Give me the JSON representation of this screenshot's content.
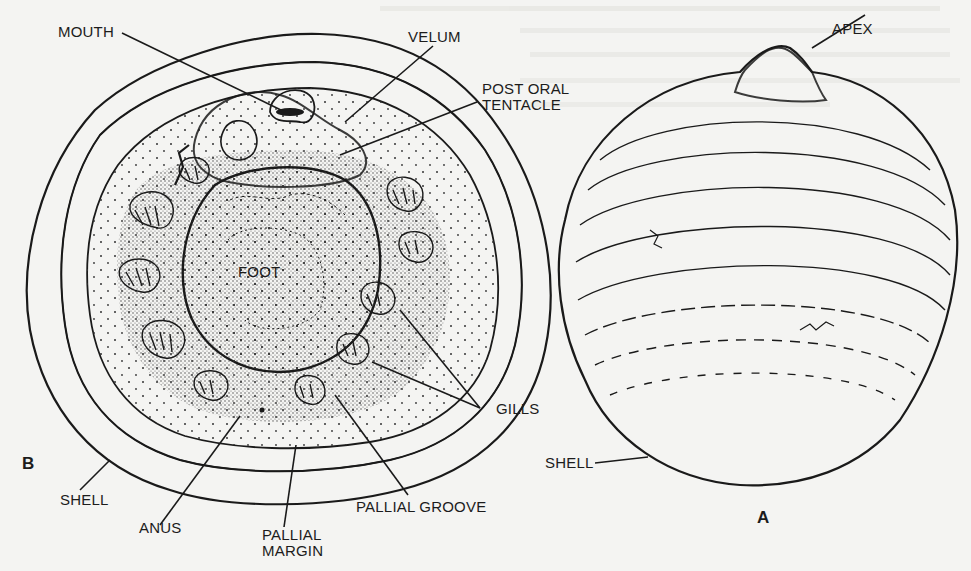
{
  "figure": {
    "background_color": "#f4f4f2",
    "ink_color": "#1a1a1a"
  },
  "panels": {
    "B": {
      "panel_label": "B",
      "view": "ventral",
      "labels": {
        "mouth": "MOUTH",
        "velum": "VELUM",
        "post_oral_tentacle_line1": "POST ORAL",
        "post_oral_tentacle_line2": "TENTACLE",
        "foot": "FOOT",
        "gills": "GILLS",
        "shell": "SHELL",
        "anus": "ANUS",
        "pallial_margin_line1": "PALLIAL",
        "pallial_margin_line2": "MARGIN",
        "pallial_groove": "PALLIAL GROOVE"
      }
    },
    "A": {
      "panel_label": "A",
      "view": "dorsal",
      "labels": {
        "apex": "APEX",
        "shell": "SHELL"
      }
    }
  },
  "bleed_through_text": ""
}
